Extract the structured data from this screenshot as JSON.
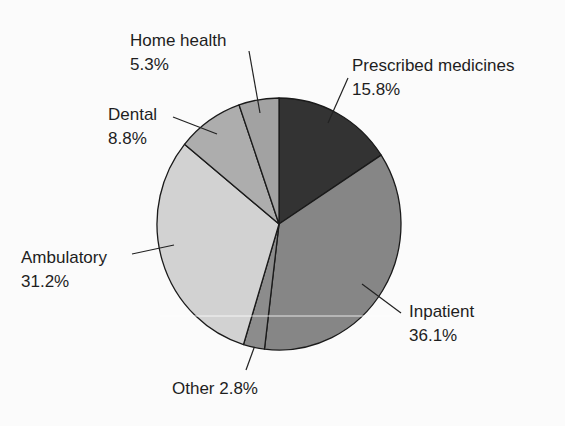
{
  "chart_data": {
    "type": "pie",
    "title": "",
    "start_angle_deg": 0,
    "direction": "clockwise",
    "slices": [
      {
        "label": "Prescribed medicines",
        "value": 15.8,
        "value_text": "15.8%",
        "color": "#333333"
      },
      {
        "label": "Inpatient",
        "value": 36.1,
        "value_text": "36.1%",
        "color": "#868686"
      },
      {
        "label": "Other",
        "value": 2.8,
        "value_text": "2.8%",
        "color": "#8c8c8c"
      },
      {
        "label": "Ambulatory",
        "value": 31.2,
        "value_text": "31.2%",
        "color": "#d2d2d2"
      },
      {
        "label": "Dental",
        "value": 8.8,
        "value_text": "8.8%",
        "color": "#adadad"
      },
      {
        "label": "Home health",
        "value": 5.3,
        "value_text": "5.3%",
        "color": "#a2a2a2"
      }
    ]
  },
  "labels": {
    "prescribed": {
      "name": "Prescribed medicines",
      "pct": "15.8%"
    },
    "inpatient": {
      "name": "Inpatient",
      "pct": "36.1%"
    },
    "other": {
      "text": "Other 2.8%"
    },
    "ambulatory": {
      "name": "Ambulatory",
      "pct": "31.2%"
    },
    "dental": {
      "name": "Dental",
      "pct": "8.8%"
    },
    "home_health": {
      "name": "Home health",
      "pct": "5.3%"
    }
  }
}
